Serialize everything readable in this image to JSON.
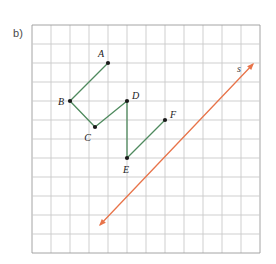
{
  "figure": {
    "part_label": "b)",
    "background_color": "#ffffff",
    "grid": {
      "color": "#9a9a9a",
      "minor_color": "#c9c9c9",
      "x_start": 32,
      "y_start": 25,
      "cell_size": 19,
      "cols": 12,
      "rows": 12
    },
    "polyline": {
      "name": "green-path",
      "color": "#4f8a5e",
      "stroke_width": 1.3,
      "vertices_order": [
        "A",
        "B",
        "C",
        "D",
        "E",
        "F"
      ],
      "segments": [
        {
          "from": "A",
          "to": "B"
        },
        {
          "from": "B",
          "to": "C"
        },
        {
          "from": "C",
          "to": "D"
        },
        {
          "from": "D",
          "to": "E"
        },
        {
          "from": "E",
          "to": "F"
        }
      ]
    },
    "points": [
      {
        "id": "A",
        "label": "A",
        "x": 108,
        "y": 63,
        "label_dx": -4,
        "label_dy": -6,
        "label_anchor": "end"
      },
      {
        "id": "B",
        "label": "B",
        "x": 70,
        "y": 101,
        "label_dx": -6,
        "label_dy": 4,
        "label_anchor": "end"
      },
      {
        "id": "C",
        "label": "C",
        "x": 95,
        "y": 127,
        "label_dx": -4,
        "label_dy": 14,
        "label_anchor": "end"
      },
      {
        "id": "D",
        "label": "D",
        "x": 127,
        "y": 101,
        "label_dx": 5,
        "label_dy": -2,
        "label_anchor": "start"
      },
      {
        "id": "E",
        "label": "E",
        "x": 127,
        "y": 158,
        "label_dx": -1,
        "label_dy": 15,
        "label_anchor": "middle"
      },
      {
        "id": "F",
        "label": "F",
        "x": 165,
        "y": 120,
        "label_dx": 5,
        "label_dy": -2,
        "label_anchor": "start"
      }
    ],
    "point_style": {
      "fill": "#1a1a1a",
      "radius": 2.1
    },
    "label_style": {
      "color": "#1a1a1a",
      "font_size": 10,
      "font_style": "italic"
    },
    "line_s": {
      "name": "line-s",
      "label": "s",
      "color": "#e8744a",
      "stroke_width": 1.3,
      "x1": 99,
      "y1": 226,
      "x2": 254,
      "y2": 63,
      "arrow_both_ends": true,
      "label_x": 239,
      "label_y": 72
    }
  }
}
